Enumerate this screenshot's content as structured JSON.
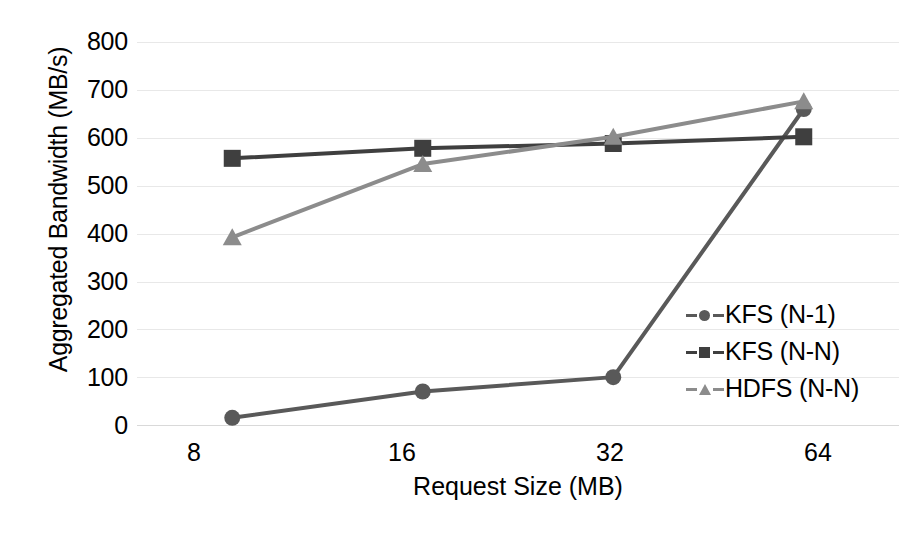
{
  "chart_data": {
    "type": "line",
    "title": "",
    "xlabel": "Request Size (MB)",
    "ylabel": "Aggregated Bandwidth (MB/s)",
    "categories": [
      "8",
      "16",
      "32",
      "64"
    ],
    "x": [
      8,
      16,
      32,
      64
    ],
    "ylim": [
      0,
      800
    ],
    "yticks": [
      0,
      100,
      200,
      300,
      400,
      500,
      600,
      700,
      800
    ],
    "ytick_labels": [
      "0",
      "100",
      "200",
      "300",
      "400",
      "500",
      "600",
      "700",
      "800"
    ],
    "grid": true,
    "grid_axis": "y",
    "legend_position": "right-inside",
    "series": [
      {
        "name": "KFS (N-1)",
        "marker": "circle",
        "color": "#595959",
        "linestyle": "solid",
        "values": [
          15,
          70,
          100,
          660
        ]
      },
      {
        "name": "KFS (N-N)",
        "marker": "square",
        "color": "#3f3f3f",
        "linestyle": "solid",
        "values": [
          557,
          578,
          588,
          602
        ]
      },
      {
        "name": "HDFS (N-N)",
        "marker": "triangle",
        "color": "#8c8c8c",
        "linestyle": "solid",
        "values": [
          392,
          545,
          602,
          676
        ]
      }
    ]
  },
  "axes": {
    "y_title": "Aggregated Bandwidth (MB/s)",
    "x_title": "Request Size (MB)",
    "y_tick_800": "800",
    "y_tick_700": "700",
    "y_tick_600": "600",
    "y_tick_500": "500",
    "y_tick_400": "400",
    "y_tick_300": "300",
    "y_tick_200": "200",
    "y_tick_100": "100",
    "y_tick_0": "0",
    "x_tick_8": "8",
    "x_tick_16": "16",
    "x_tick_32": "32",
    "x_tick_64": "64"
  },
  "legend": {
    "items": [
      {
        "label": "KFS (N-1)",
        "marker": "circle-marker",
        "color": "#595959"
      },
      {
        "label": "KFS (N-N)",
        "marker": "square-marker",
        "color": "#3f3f3f"
      },
      {
        "label": "HDFS (N-N)",
        "marker": "triangle-marker",
        "color": "#8c8c8c"
      }
    ]
  },
  "colors": {
    "background": "#ffffff",
    "gridline": "#e8e8e8",
    "text": "#000000",
    "series_kfs_n1": "#595959",
    "series_kfs_nn": "#3f3f3f",
    "series_hdfs_nn": "#8c8c8c"
  }
}
